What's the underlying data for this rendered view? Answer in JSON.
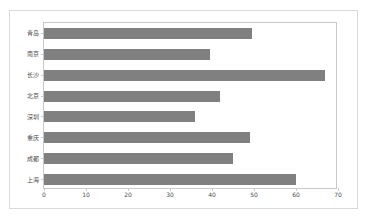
{
  "chart_data": {
    "type": "bar",
    "orientation": "horizontal",
    "title": "",
    "xlabel": "",
    "ylabel": "",
    "categories": [
      "青岛",
      "南京",
      "长沙",
      "北京",
      "深圳",
      "重庆",
      "成都",
      "上海"
    ],
    "values": [
      49.5,
      39.5,
      67,
      42,
      36,
      49,
      45,
      60
    ],
    "series": [
      {
        "name": "",
        "values": [
          49.5,
          39.5,
          67,
          42,
          36,
          49,
          45,
          60
        ]
      }
    ],
    "xlim": [
      0,
      70
    ],
    "xticks": [
      0,
      10,
      20,
      30,
      40,
      50,
      60,
      70
    ],
    "xtick_labels": [
      "0",
      "10",
      "20",
      "30",
      "40",
      "50",
      "60",
      "70"
    ],
    "grid": false,
    "legend": "none",
    "bar_color": "#808080",
    "plot_border_color": "#c8c8c8",
    "frame_border_color": "#d9d9d9",
    "background_color": "#ffffff"
  }
}
